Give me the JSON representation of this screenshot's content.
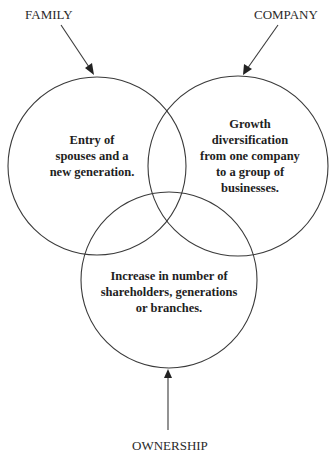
{
  "diagram": {
    "type": "three-circle venn",
    "circles": [
      {
        "id": "family",
        "label": "FAMILY",
        "text_lines": [
          "Entry of",
          "spouses and a",
          "new generation."
        ]
      },
      {
        "id": "company",
        "label": "COMPANY",
        "text_lines": [
          "Growth",
          "diversification",
          "from one company",
          "to a group of",
          "businesses."
        ]
      },
      {
        "id": "ownership",
        "label": "OWNERSHIP",
        "text_lines": [
          "Increase in number of",
          "shareholders, generations",
          "or branches."
        ]
      }
    ],
    "colors": {
      "background": "#ffffff",
      "stroke": "#3a3a3a",
      "text": "#1e1e1e"
    }
  }
}
